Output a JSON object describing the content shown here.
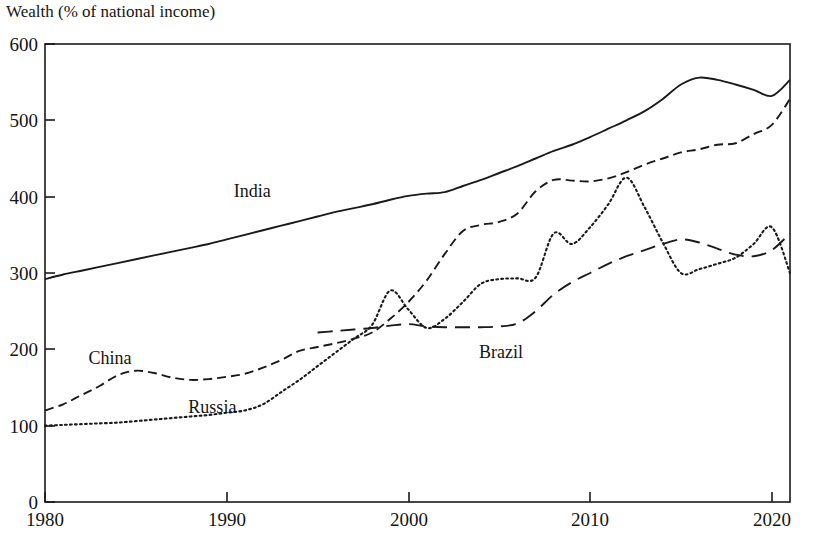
{
  "chart_data": {
    "type": "line",
    "title": "Wealth (% of national income)",
    "xlabel": "",
    "ylabel": "",
    "xlim": [
      1980,
      2021
    ],
    "ylim": [
      0,
      600
    ],
    "grid": false,
    "legend_position": "inline-annotations",
    "x_ticks": [
      1980,
      1990,
      2000,
      2010,
      2020
    ],
    "y_ticks": [
      0,
      100,
      200,
      300,
      400,
      500,
      600
    ],
    "x": [
      1980,
      1981,
      1982,
      1983,
      1984,
      1985,
      1986,
      1987,
      1988,
      1989,
      1990,
      1991,
      1992,
      1993,
      1994,
      1995,
      1996,
      1997,
      1998,
      1999,
      2000,
      2001,
      2002,
      2003,
      2004,
      2005,
      2006,
      2007,
      2008,
      2009,
      2010,
      2011,
      2012,
      2013,
      2014,
      2015,
      2016,
      2017,
      2018,
      2019,
      2020,
      2021
    ],
    "series": [
      {
        "name": "India",
        "line_style": "solid",
        "color": "#1a1a1a",
        "label_position": {
          "x": 1990.5,
          "y": 408
        },
        "values": [
          292,
          298,
          303,
          308,
          313,
          318,
          323,
          328,
          333,
          338,
          344,
          350,
          356,
          362,
          368,
          374,
          380,
          385,
          390,
          396,
          401,
          404,
          406,
          414,
          422,
          431,
          440,
          450,
          460,
          468,
          478,
          489,
          500,
          512,
          528,
          547,
          556,
          553,
          547,
          540,
          532,
          553
        ]
      },
      {
        "name": "China",
        "line_style": "dashed",
        "color": "#1a1a1a",
        "label_position": {
          "x": 1982.5,
          "y": 188
        },
        "values": [
          120,
          128,
          140,
          152,
          166,
          172,
          169,
          163,
          160,
          161,
          164,
          168,
          176,
          186,
          198,
          203,
          208,
          214,
          222,
          240,
          262,
          290,
          325,
          355,
          363,
          367,
          378,
          407,
          422,
          421,
          420,
          424,
          432,
          442,
          450,
          458,
          462,
          468,
          470,
          482,
          494,
          528
        ]
      },
      {
        "name": "Russia",
        "line_style": "dotted",
        "color": "#1a1a1a",
        "label_position": {
          "x": 1988.0,
          "y": 125
        },
        "values": [
          100,
          101,
          102,
          103,
          104,
          106,
          108,
          110,
          112,
          114,
          117,
          120,
          128,
          144,
          160,
          178,
          196,
          214,
          232,
          277,
          252,
          228,
          240,
          262,
          286,
          292,
          293,
          294,
          352,
          338,
          360,
          390,
          425,
          386,
          340,
          300,
          305,
          312,
          320,
          338,
          360,
          300
        ]
      },
      {
        "name": "Brazil",
        "line_style": "longdash",
        "color": "#1a1a1a",
        "label_position": {
          "x": 2004.0,
          "y": 196
        },
        "start_year": 1995,
        "values": [
          null,
          null,
          null,
          null,
          null,
          null,
          null,
          null,
          null,
          null,
          null,
          null,
          null,
          null,
          null,
          222,
          224,
          226,
          228,
          231,
          233,
          230,
          229,
          229,
          229,
          230,
          234,
          250,
          272,
          288,
          300,
          312,
          322,
          330,
          338,
          344,
          340,
          332,
          324,
          322,
          330,
          352
        ]
      }
    ]
  },
  "axis": {
    "y_tick_labels": [
      "600",
      "500",
      "400",
      "300",
      "200",
      "100",
      "0"
    ],
    "x_tick_labels": [
      "1980",
      "1990",
      "2000",
      "2010",
      "2020"
    ]
  }
}
